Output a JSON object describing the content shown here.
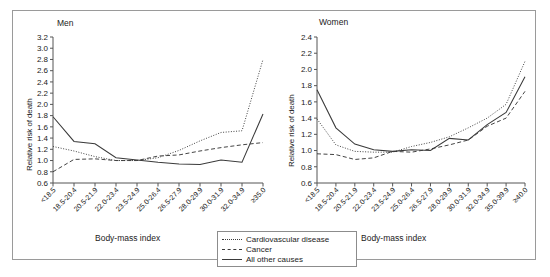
{
  "figure": {
    "background": "#ffffff",
    "line_color": "#3a3a3a",
    "axis_color": "#555555",
    "border_color": "#9a9a9a"
  },
  "legend": {
    "position": "bottom-center",
    "items": [
      {
        "label": "Cardiovascular disease",
        "style": "dotted"
      },
      {
        "label": "Cancer",
        "style": "dashed"
      },
      {
        "label": "All other causes",
        "style": "solid"
      }
    ]
  },
  "chart_data": [
    {
      "type": "line",
      "title": "Men",
      "xlabel": "Body-mass index",
      "ylabel": "Relative risk of death",
      "ylim": [
        0.6,
        3.2
      ],
      "yticks": [
        0.6,
        0.8,
        1.0,
        1.2,
        1.4,
        1.6,
        1.8,
        2.0,
        2.2,
        2.4,
        2.6,
        2.8,
        3.0,
        3.2
      ],
      "ytick_labels": [
        "0.6",
        "0.8",
        "1.0",
        "1.2",
        "1.4",
        "1.6",
        "1.8",
        "2.0",
        "2.2",
        "2.4",
        "2.6",
        "2.8",
        "3.0",
        "3.2"
      ],
      "grid": false,
      "categories": [
        "<18.5",
        "18.5-20.4",
        "20.5-21.9",
        "22.0-23.4",
        "23.5-24.9",
        "25.0-26.4",
        "26.5-27.9",
        "28.0-29.9",
        "30.0-31.9",
        "32.0-34.9",
        "≥35.0"
      ],
      "series": [
        {
          "name": "Cardiovascular disease",
          "style": "dotted",
          "values": [
            1.25,
            1.17,
            1.07,
            1.0,
            1.0,
            1.05,
            1.18,
            1.35,
            1.5,
            1.53,
            2.8
          ]
        },
        {
          "name": "Cancer",
          "style": "dashed",
          "values": [
            0.8,
            1.02,
            1.03,
            1.0,
            1.0,
            1.08,
            1.1,
            1.17,
            1.23,
            1.28,
            1.32
          ]
        },
        {
          "name": "All other causes",
          "style": "solid",
          "values": [
            1.78,
            1.34,
            1.3,
            1.05,
            1.01,
            0.97,
            0.94,
            0.93,
            1.01,
            0.97,
            1.83
          ]
        }
      ]
    },
    {
      "type": "line",
      "title": "Women",
      "xlabel": "Body-mass index",
      "ylabel": "Relative risk of death",
      "ylim": [
        0.6,
        2.4
      ],
      "yticks": [
        0.6,
        0.8,
        1.0,
        1.2,
        1.4,
        1.6,
        1.8,
        2.0,
        2.2,
        2.4
      ],
      "ytick_labels": [
        "0.6",
        "0.8",
        "1.0",
        "1.2",
        "1.4",
        "1.6",
        "1.8",
        "2.0",
        "2.2",
        "2.4"
      ],
      "grid": false,
      "categories": [
        "<18.5",
        "18.5-20.4",
        "20.5-21.9",
        "22.0-23.4",
        "23.5-24.9",
        "25.0-26.4",
        "26.5-27.9",
        "28.0-29.9",
        "30.0-31.9",
        "32.0-34.9",
        "35.0-39.9",
        "≥40.0"
      ],
      "series": [
        {
          "name": "Cardiovascular disease",
          "style": "dotted",
          "values": [
            1.39,
            1.07,
            0.99,
            0.98,
            0.98,
            1.05,
            1.1,
            1.17,
            1.28,
            1.4,
            1.57,
            2.1
          ]
        },
        {
          "name": "Cancer",
          "style": "dashed",
          "values": [
            0.96,
            0.95,
            0.89,
            0.91,
            0.99,
            0.98,
            1.02,
            1.07,
            1.13,
            1.3,
            1.4,
            1.73
          ]
        },
        {
          "name": "All other causes",
          "style": "solid",
          "values": [
            1.75,
            1.28,
            1.08,
            1.01,
            0.99,
            1.01,
            1.0,
            1.15,
            1.13,
            1.32,
            1.47,
            1.91
          ]
        }
      ]
    }
  ]
}
